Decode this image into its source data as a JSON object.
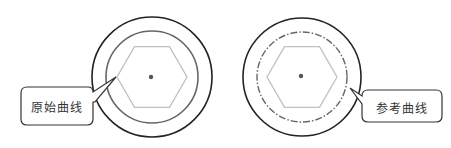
{
  "diagram": {
    "left_panel": {
      "callout_label": "原始曲线",
      "inner_circle_style": "solid"
    },
    "right_panel": {
      "callout_label": "参考曲线",
      "inner_circle_style": "dash-dot"
    },
    "colors": {
      "outer_circle": "#222222",
      "inner_circle": "#666666",
      "hexagon": "#c0c0c0",
      "center_point": "#555555",
      "callout_border": "#333333",
      "background": "#ffffff"
    }
  }
}
